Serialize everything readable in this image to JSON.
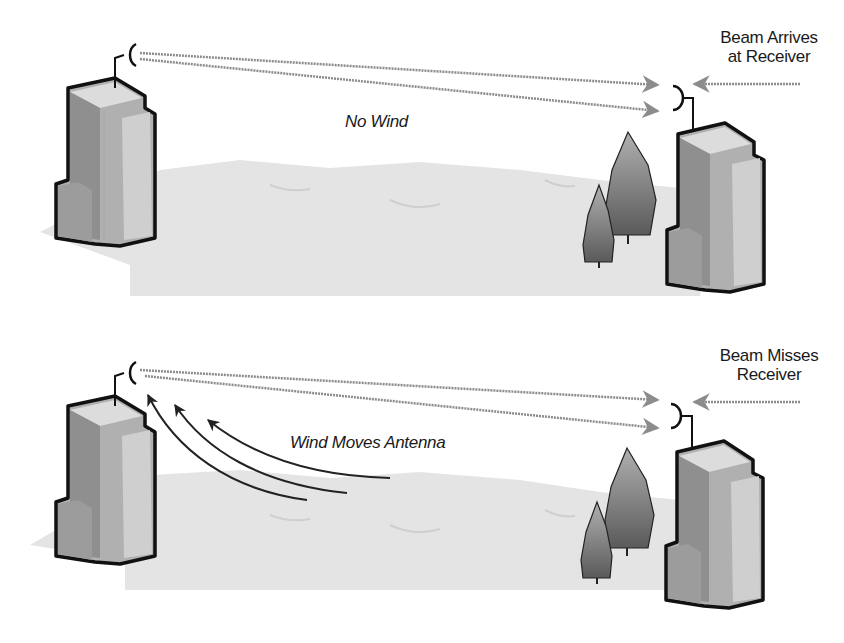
{
  "diagram": {
    "title": "",
    "panels": [
      {
        "id": "no-wind",
        "caption": "No Wind",
        "status_label_line1": "Beam Arrives",
        "status_label_line2": "at Receiver"
      },
      {
        "id": "wind",
        "caption": "Wind Moves Antenna",
        "status_label_line1": "Beam Misses",
        "status_label_line2": "Receiver"
      }
    ]
  },
  "colors": {
    "outline": "#111111",
    "building_dark": "#8a8a8a",
    "building_mid": "#b5b5b5",
    "building_light": "#d8d8d8",
    "ground": "#e4e4e4",
    "beam": "#8c8c8c",
    "tree": "#7a7a7a"
  }
}
